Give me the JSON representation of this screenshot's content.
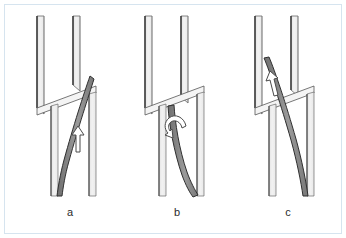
{
  "figure": {
    "type": "technical-line-diagram",
    "title_visible": false,
    "frame_border_color": "#d6e4ef",
    "background_color": "#ffffff",
    "panel_count": 3
  },
  "style": {
    "plank_fill": "#ebebeb",
    "plank_fill_light": "#f6f6f6",
    "plank_edge_stroke": "#3a3a3a",
    "plank_outline_stroke": "#555555",
    "rod_fill": "#8a8a8a",
    "rod_stroke": "#2f2f2f",
    "arrow_fill": "#ffffff",
    "arrow_stroke": "#4a4a4a",
    "caption_color": "#2b2b2b"
  },
  "panels": [
    {
      "id": "panel-a",
      "caption": "a",
      "caption_x": 70,
      "caption_y": 216,
      "arrow": {
        "name": "up-arrow",
        "kind": "straight-up",
        "label": ""
      },
      "description_visible": ""
    },
    {
      "id": "panel-b",
      "caption": "b",
      "caption_x": 177,
      "caption_y": 216,
      "arrow": {
        "name": "rotation-arrow",
        "kind": "curved-rotation",
        "label": ""
      },
      "description_visible": ""
    },
    {
      "id": "panel-c",
      "caption": "c",
      "caption_x": 288,
      "caption_y": 216,
      "arrow": {
        "name": "up-arrow",
        "kind": "straight-up-tilted",
        "label": ""
      },
      "description_visible": ""
    }
  ]
}
